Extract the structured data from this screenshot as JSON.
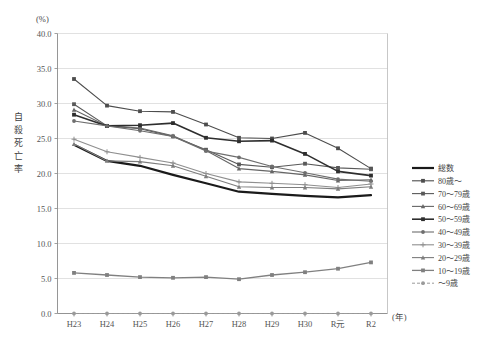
{
  "chart_data": {
    "type": "line",
    "title": "",
    "xlabel": "(年)",
    "ylabel": "自殺死亡率",
    "yunit": "(%)",
    "ylim": [
      0.0,
      40.0
    ],
    "yticks": [
      "0.0",
      "5.0",
      "10.0",
      "15.0",
      "20.0",
      "25.0",
      "30.0",
      "35.0",
      "40.0"
    ],
    "ytick_values": [
      0.0,
      5.0,
      10.0,
      15.0,
      20.0,
      25.0,
      30.0,
      35.0,
      40.0
    ],
    "grid": true,
    "legend_position": "right",
    "categories": [
      "H23",
      "H24",
      "H25",
      "H26",
      "H27",
      "H28",
      "H29",
      "H30",
      "R元",
      "R2"
    ],
    "series": [
      {
        "name": "総数",
        "color": "#1a1a1a",
        "width": 2.2,
        "marker": "none",
        "values": [
          24.1,
          21.8,
          21.1,
          19.8,
          18.6,
          17.4,
          17.1,
          16.8,
          16.6,
          16.9
        ]
      },
      {
        "name": "80歳～",
        "color": "#4d4d4d",
        "width": 1.1,
        "marker": "square",
        "values": [
          33.5,
          29.7,
          28.9,
          28.8,
          27.0,
          25.1,
          25.0,
          25.8,
          23.6,
          20.7
        ]
      },
      {
        "name": "70～79歳",
        "color": "#595959",
        "width": 1.1,
        "marker": "square",
        "values": [
          29.9,
          26.8,
          26.4,
          25.3,
          23.4,
          21.3,
          20.9,
          21.4,
          20.8,
          20.6
        ]
      },
      {
        "name": "60～69歳",
        "color": "#666666",
        "width": 1.1,
        "marker": "triangle",
        "values": [
          29.1,
          26.8,
          26.5,
          25.4,
          23.3,
          20.7,
          20.3,
          19.8,
          19.0,
          19.1
        ]
      },
      {
        "name": "50～59歳",
        "color": "#2e2e2e",
        "width": 1.6,
        "marker": "square",
        "values": [
          28.4,
          26.8,
          26.9,
          27.2,
          25.1,
          24.6,
          24.7,
          22.8,
          20.3,
          19.7
        ]
      },
      {
        "name": "40～49歳",
        "color": "#6e6e6e",
        "width": 1.1,
        "marker": "circle",
        "values": [
          27.5,
          26.8,
          26.1,
          25.3,
          23.2,
          22.3,
          21.0,
          20.1,
          19.2,
          18.9
        ]
      },
      {
        "name": "30～39歳",
        "color": "#8f8f8f",
        "width": 1.1,
        "marker": "plus",
        "values": [
          24.9,
          23.1,
          22.3,
          21.5,
          20.0,
          18.8,
          18.6,
          18.4,
          18.0,
          18.5
        ]
      },
      {
        "name": "20～29歳",
        "color": "#7d7d7d",
        "width": 1.1,
        "marker": "triangle",
        "values": [
          24.2,
          21.8,
          21.7,
          21.1,
          19.6,
          18.1,
          18.0,
          18.0,
          17.8,
          18.1
        ]
      },
      {
        "name": "10～19歳",
        "color": "#808080",
        "width": 1.3,
        "marker": "square",
        "values": [
          5.8,
          5.5,
          5.2,
          5.1,
          5.2,
          4.9,
          5.5,
          5.9,
          6.4,
          7.3
        ]
      },
      {
        "name": "～9歳",
        "color": "#9a9a9a",
        "width": 1.0,
        "marker": "circle",
        "dash": "3,2",
        "values": [
          0.0,
          0.0,
          0.0,
          0.0,
          0.0,
          0.0,
          0.0,
          0.0,
          0.0,
          0.0
        ]
      }
    ]
  },
  "legend": {
    "items": [
      {
        "label": "総数"
      },
      {
        "label": "80歳～"
      },
      {
        "label": "70～79歳"
      },
      {
        "label": "60～69歳"
      },
      {
        "label": "50～59歳"
      },
      {
        "label": "40～49歳"
      },
      {
        "label": "30～39歳"
      },
      {
        "label": "20～29歳"
      },
      {
        "label": "10～19歳"
      },
      {
        "label": "～9歳"
      }
    ]
  }
}
